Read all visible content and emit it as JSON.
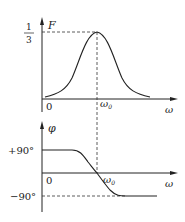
{
  "top_plot": {
    "y_axis_label": "F",
    "peak_label_numerator": "1",
    "peak_label_denominator": "3",
    "origin_label": "0",
    "center_freq_label": "ω",
    "center_freq_subscript": "0",
    "x_axis_label": "ω"
  },
  "bottom_plot": {
    "y_axis_label": "φ",
    "upper_level_label": "+90°",
    "lower_level_label": "−90°",
    "origin_label": "0",
    "center_freq_label": "ω",
    "center_freq_subscript": "0",
    "x_axis_label": "ω"
  },
  "colors": {
    "line": "#222222",
    "dashed": "#333333"
  }
}
